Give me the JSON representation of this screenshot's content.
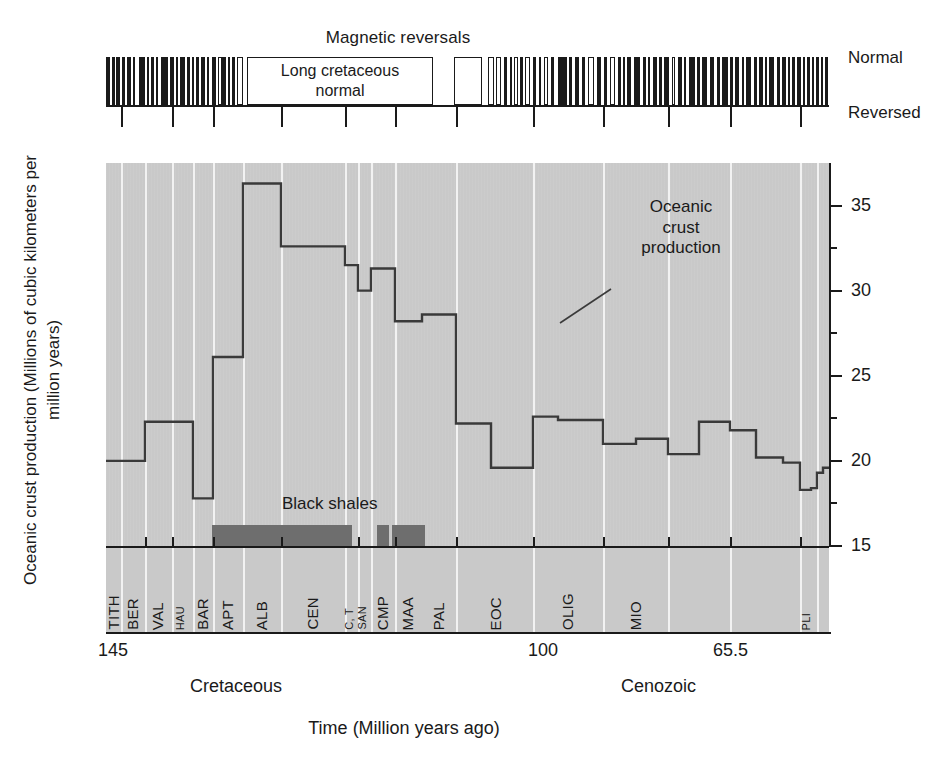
{
  "figure": {
    "magnetic": {
      "title": "Magnetic reversals",
      "normal_label": "Normal",
      "reversed_label": "Reversed",
      "long_normal_label_line1": "Long cretaceous",
      "long_normal_label_line2": "normal"
    },
    "annotation": {
      "curve_line1": "Oceanic",
      "curve_line2": "crust",
      "curve_line3": "production"
    },
    "black_shales_label": "Black shales",
    "yaxis_title": "Oceanic crust production (Millions of cubic kilometers per million years)",
    "xaxis_title": "Time (Million years ago)",
    "eras": [
      {
        "name": "Cretaceous"
      },
      {
        "name": "Cenozoic"
      }
    ]
  },
  "chart_data": {
    "type": "line",
    "title": "Oceanic crust production",
    "xlabel": "Time (Million years ago)",
    "ylabel": "Oceanic crust production (Millions of cubic kilometers per million years)",
    "xlim": [
      150,
      0
    ],
    "ylim": [
      15,
      37.5
    ],
    "x_tick_labels": [
      "145",
      "100",
      "65.5"
    ],
    "x_tick_values": [
      145,
      100,
      65.5
    ],
    "y_tick_labels": [
      "15",
      "20",
      "25",
      "30",
      "35"
    ],
    "y_tick_values": [
      15,
      20,
      25,
      30,
      35
    ],
    "y_minor_step": 2.5,
    "grid": "vertical-stage-boundaries",
    "legend": "none",
    "series_name": "Oceanic crust production",
    "step_series": [
      {
        "stage": "TITH",
        "age_start": 150.8,
        "age_end": 145.5,
        "value": 20.0
      },
      {
        "stage": "BER",
        "age_start": 145.5,
        "age_end": 140.2,
        "value": 20.0
      },
      {
        "stage": "VAL",
        "age_start": 140.2,
        "age_end": 133.9,
        "value": 22.3
      },
      {
        "stage": "HAU",
        "age_start": 133.9,
        "age_end": 130.0,
        "value": 22.3
      },
      {
        "stage": "BAR",
        "age_start": 130.0,
        "age_end": 125.0,
        "value": 17.8
      },
      {
        "stage": "APT-lower",
        "age_start": 125.0,
        "age_end": 121.0,
        "value": 26.1
      },
      {
        "stage": "APT-upper",
        "age_start": 121.0,
        "age_end": 112.0,
        "value": 36.3
      },
      {
        "stage": "ALB-1",
        "age_start": 112.0,
        "age_end": 107.0,
        "value": 32.6
      },
      {
        "stage": "ALB-2",
        "age_start": 107.0,
        "age_end": 102.0,
        "value": 31.5
      },
      {
        "stage": "ALB-3",
        "age_start": 102.0,
        "age_end": 99.6,
        "value": 30.0
      },
      {
        "stage": "CEN",
        "age_start": 99.6,
        "age_end": 95.0,
        "value": 31.3
      },
      {
        "stage": "C-T",
        "age_start": 95.0,
        "age_end": 89.3,
        "value": 28.2
      },
      {
        "stage": "SAN",
        "age_start": 89.3,
        "age_end": 85.8,
        "value": 28.6
      },
      {
        "stage": "CMP",
        "age_start": 85.8,
        "age_end": 70.6,
        "value": 22.2
      },
      {
        "stage": "MAA",
        "age_start": 70.6,
        "age_end": 65.5,
        "value": 19.6
      },
      {
        "stage": "PAL-1",
        "age_start": 65.5,
        "age_end": 61.0,
        "value": 22.6
      },
      {
        "stage": "PAL-2",
        "age_start": 61.0,
        "age_end": 55.8,
        "value": 22.4
      },
      {
        "stage": "EOC-1",
        "age_start": 55.8,
        "age_end": 49.0,
        "value": 21.0
      },
      {
        "stage": "EOC-2",
        "age_start": 49.0,
        "age_end": 44.0,
        "value": 21.3
      },
      {
        "stage": "EOC-3",
        "age_start": 44.0,
        "age_end": 37.0,
        "value": 20.4
      },
      {
        "stage": "EOC-4",
        "age_start": 37.0,
        "age_end": 33.9,
        "value": 22.3
      },
      {
        "stage": "OLIG-1",
        "age_start": 33.9,
        "age_end": 28.4,
        "value": 21.8
      },
      {
        "stage": "OLIG-2",
        "age_start": 28.4,
        "age_end": 23.0,
        "value": 20.2
      },
      {
        "stage": "MIO-1",
        "age_start": 23.0,
        "age_end": 16.0,
        "value": 19.9
      },
      {
        "stage": "MIO-2",
        "age_start": 16.0,
        "age_end": 11.6,
        "value": 18.3
      },
      {
        "stage": "MIO-3",
        "age_start": 11.6,
        "age_end": 7.2,
        "value": 18.4
      },
      {
        "stage": "MIO-4",
        "age_start": 7.2,
        "age_end": 5.3,
        "value": 19.3
      },
      {
        "stage": "PLI",
        "age_start": 5.3,
        "age_end": 0.0,
        "value": 19.6
      }
    ],
    "stages": [
      {
        "label": "TITH",
        "size": "normal"
      },
      {
        "label": "BER",
        "size": "normal"
      },
      {
        "label": "VAL",
        "size": "normal"
      },
      {
        "label": "HAU",
        "size": "small"
      },
      {
        "label": "BAR",
        "size": "normal"
      },
      {
        "label": "APT",
        "size": "normal"
      },
      {
        "label": "ALB",
        "size": "normal"
      },
      {
        "label": "CEN",
        "size": "normal"
      },
      {
        "label": "C, T",
        "size": "small"
      },
      {
        "label": "SAN",
        "size": "small"
      },
      {
        "label": "CMP",
        "size": "normal"
      },
      {
        "label": "MAA",
        "size": "normal"
      },
      {
        "label": "PAL",
        "size": "normal"
      },
      {
        "label": "EOC",
        "size": "normal"
      },
      {
        "label": "OLIG",
        "size": "normal"
      },
      {
        "label": "MIO",
        "size": "normal"
      },
      {
        "label": "PLI",
        "size": "small"
      }
    ],
    "black_shales_intervals": [
      {
        "start_px": 212,
        "end_px": 352
      },
      {
        "start_px": 377,
        "end_px": 389
      },
      {
        "start_px": 392,
        "end_px": 425
      }
    ],
    "magnetic_reversals_note": "Barcode of normal (black) and reversed (white) polarity intervals; the Cretaceous Normal Superchron appears as one wide white-outlined block labelled 'Long cretaceous normal'."
  },
  "colors": {
    "plot_background": "#c9c9c9",
    "gridline": "#f2f2f2",
    "curve": "#3a3a3a",
    "black_shales": "#6e6e6e",
    "ink": "#1a1a1a",
    "page": "#ffffff"
  }
}
